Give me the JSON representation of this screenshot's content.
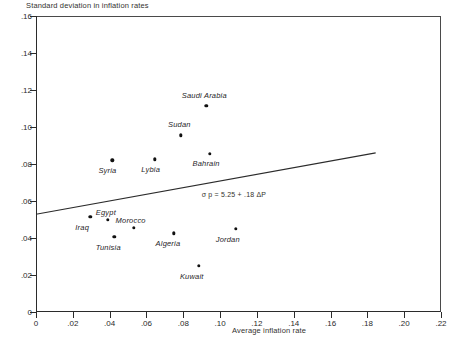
{
  "chart_data": {
    "type": "scatter",
    "title": "",
    "ylabel": "Standard deviation in inflation rates",
    "xlabel": "Average inflation rate",
    "xlim": [
      0,
      0.22
    ],
    "ylim": [
      0,
      0.16
    ],
    "xticks": [
      "0",
      ".02",
      ".04",
      ".06",
      ".08",
      ".10",
      ".12",
      ".14",
      ".16",
      ".18",
      ".20",
      ".22"
    ],
    "xtick_values": [
      0,
      0.02,
      0.04,
      0.06,
      0.08,
      0.1,
      0.12,
      0.14,
      0.16,
      0.18,
      0.2,
      0.22
    ],
    "yticks": [
      "0",
      ".02",
      ".04",
      ".06",
      ".08",
      ".10",
      ".12",
      ".14",
      ".16"
    ],
    "ytick_values": [
      0,
      0.02,
      0.04,
      0.06,
      0.08,
      0.1,
      0.12,
      0.14,
      0.16
    ],
    "grid": false,
    "legend": "none",
    "points": [
      {
        "label": "Saudi Arabia",
        "x": 0.0925,
        "y": 0.1115,
        "label_dx": -2,
        "label_dy": -11
      },
      {
        "label": "Sudan",
        "x": 0.0785,
        "y": 0.0955,
        "label_dx": -1,
        "label_dy": -11
      },
      {
        "label": "Bahrain",
        "x": 0.0945,
        "y": 0.0855,
        "label_dx": -4,
        "label_dy": 9
      },
      {
        "label": "Lybia",
        "x": 0.0645,
        "y": 0.0825,
        "label_dx": -4,
        "label_dy": 10
      },
      {
        "label": "Syria",
        "x": 0.0415,
        "y": 0.082,
        "label_dx": -5,
        "label_dy": 10
      },
      {
        "label": "Iraq",
        "x": 0.0295,
        "y": 0.0515,
        "label_dx": -8,
        "label_dy": 10
      },
      {
        "label": "Egypt",
        "x": 0.039,
        "y": 0.05,
        "label_dx": -2,
        "label_dy": -8
      },
      {
        "label": "Morocco",
        "x": 0.053,
        "y": 0.0455,
        "label_dx": -3,
        "label_dy": -8
      },
      {
        "label": "Tunisia",
        "x": 0.0425,
        "y": 0.0405,
        "label_dx": -6,
        "label_dy": 10
      },
      {
        "label": "Algeria",
        "x": 0.075,
        "y": 0.0425,
        "label_dx": -6,
        "label_dy": 10
      },
      {
        "label": "Jordan",
        "x": 0.1085,
        "y": 0.045,
        "label_dx": -8,
        "label_dy": 10
      },
      {
        "label": "Kuwait",
        "x": 0.0885,
        "y": 0.025,
        "label_dx": -7,
        "label_dy": 10
      }
    ],
    "regression": {
      "equation": "σ p = 5.25 + .18 ΔP",
      "intercept": 0.0528,
      "slope": 0.18,
      "x_start": 0.0,
      "x_end": 0.1845,
      "y_start": 0.0528,
      "y_end": 0.086
    },
    "colors": {
      "axis": "#2b2b2b",
      "point": "#111111",
      "line": "#2b2b2b",
      "text": "#26251f",
      "background": "#ffffff"
    }
  }
}
